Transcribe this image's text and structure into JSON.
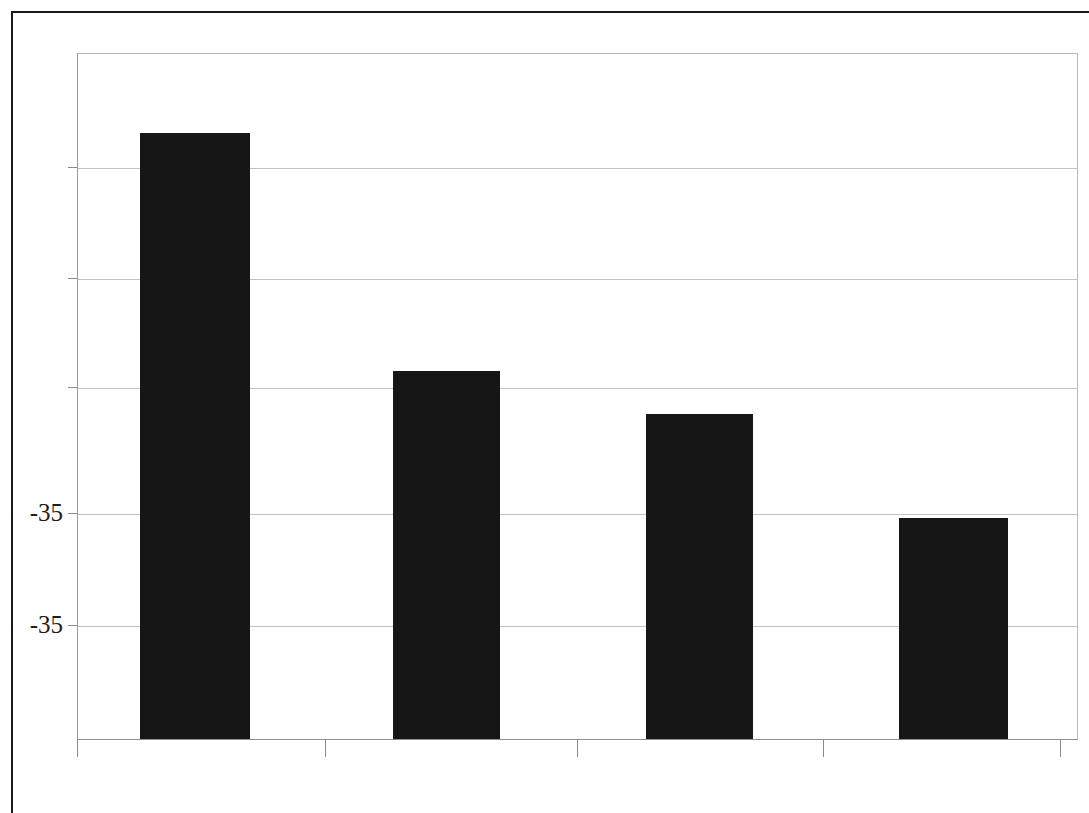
{
  "figure": {
    "name": "bar-chart",
    "background_color": "#ffffff",
    "frame_color": "#1a1a1a",
    "has_outer_frame": true
  },
  "chart_data": {
    "type": "bar",
    "title": "",
    "subtitle": "",
    "xlabel": "",
    "ylabel": "",
    "categories": [
      "",
      "",
      "",
      ""
    ],
    "values": [
      -35.0,
      -53.6,
      -56.9,
      -65.1
    ],
    "bar_pixel_heights": [
      606,
      368,
      325,
      221
    ],
    "bar_color": "#161616",
    "grid": true,
    "grid_color": "#c2c2c2",
    "legend": "none",
    "ylim": [
      -70.0,
      -5.0
    ],
    "yticks": [
      -5.0,
      -15.0,
      -25.0,
      -35.0,
      -45.0,
      -55.0
    ],
    "ytick_labels": [
      "",
      "",
      "",
      "-35",
      "-35",
      ""
    ],
    "visible_ytick_labels": [
      "-35",
      "-35"
    ],
    "xticks": [
      0,
      1,
      2,
      3,
      4
    ],
    "xtick_labels": [
      "",
      "",
      "",
      "",
      ""
    ],
    "axis_line_color": "#8e8e8e",
    "plot_border_color": "#b9b9b9"
  },
  "axes": {
    "y_labels": [
      {
        "text": "-35",
        "y": 513
      },
      {
        "text": "-35",
        "y": 625
      }
    ],
    "gridlines_y": [
      167,
      278,
      387,
      513,
      625
    ],
    "x_ticks_x": [
      77,
      325,
      577,
      823,
      1060
    ]
  },
  "bars": [
    {
      "label": "bar-1",
      "left": 140,
      "width": 110,
      "top": 133,
      "height": 606
    },
    {
      "label": "bar-2",
      "left": 393,
      "width": 107,
      "top": 371,
      "height": 368
    },
    {
      "label": "bar-3",
      "left": 646,
      "width": 107,
      "top": 414,
      "height": 325
    },
    {
      "label": "bar-4",
      "left": 899,
      "width": 109,
      "top": 518,
      "height": 221
    }
  ]
}
